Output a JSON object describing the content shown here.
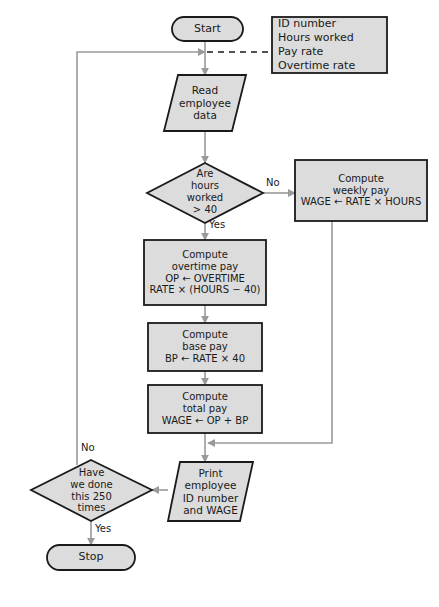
{
  "diagram": {
    "colors": {
      "shape_fill": "#dcdcdc",
      "shape_stroke": "#1a1a1a",
      "connector": "#9a9a9a",
      "text": "#1a1a1a",
      "background": "#ffffff"
    },
    "nodes": {
      "start": {
        "type": "terminal",
        "label": "Start"
      },
      "annotation": {
        "type": "note",
        "lines": [
          "ID number",
          "Hours worked",
          "Pay rate",
          "Overtime rate"
        ]
      },
      "read_data": {
        "type": "input-output",
        "lines": [
          "Read",
          "employee",
          "data"
        ]
      },
      "decision_hours": {
        "type": "decision",
        "lines": [
          "Are",
          "hours",
          "worked",
          "> 40"
        ]
      },
      "weekly_pay": {
        "type": "process",
        "lines": [
          "Compute",
          "weekly pay",
          "WAGE ← RATE × HOURS"
        ]
      },
      "overtime_pay": {
        "type": "process",
        "lines": [
          "Compute",
          "overtime pay",
          "OP ← OVERTIME",
          "RATE × (HOURS − 40)"
        ]
      },
      "base_pay": {
        "type": "process",
        "lines": [
          "Compute",
          "base pay",
          "BP ← RATE × 40"
        ]
      },
      "total_pay": {
        "type": "process",
        "lines": [
          "Compute",
          "total pay",
          "WAGE ← OP + BP"
        ]
      },
      "print_out": {
        "type": "input-output",
        "lines": [
          "Print",
          "employee",
          "ID number",
          "and WAGE"
        ]
      },
      "decision_count": {
        "type": "decision",
        "lines": [
          "Have",
          "we done",
          "this 250",
          "times"
        ]
      },
      "stop": {
        "type": "terminal",
        "label": "Stop"
      }
    },
    "edge_labels": {
      "hours_no": "No",
      "hours_yes": "Yes",
      "count_no": "No",
      "count_yes": "Yes"
    }
  }
}
